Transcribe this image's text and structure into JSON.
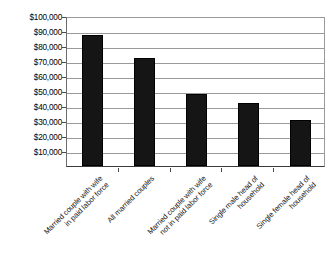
{
  "chart_data": {
    "type": "bar",
    "title": "",
    "xlabel": "",
    "ylabel": "Median Annual Income",
    "ylim": [
      0,
      100000
    ],
    "ytick_step": 10000,
    "grid": true,
    "legend": "none",
    "bar_color": "#151515",
    "categories": [
      "Married couple with wife in paid labor force",
      "All married couples",
      "Married couple with wife not in paid labor force",
      "Single male head of household",
      "Single female head of household"
    ],
    "category_lines": [
      [
        "Married couple with wife",
        "in paid labor force"
      ],
      [
        "All married couples"
      ],
      [
        "Married couple with wife",
        "not in paid labor force"
      ],
      [
        "Single male head of",
        "household"
      ],
      [
        "Single female head of",
        "household"
      ]
    ],
    "values": [
      87000,
      72000,
      48000,
      42000,
      30500
    ],
    "ytick_labels": [
      "$100,000",
      "$90,000",
      "$80,000",
      "$70,000",
      "$60,000",
      "$50,000",
      "$40,000",
      "$30,000",
      "$20,000",
      "$10,000"
    ],
    "ytick_values": [
      100000,
      90000,
      80000,
      70000,
      60000,
      50000,
      40000,
      30000,
      20000,
      10000
    ]
  }
}
